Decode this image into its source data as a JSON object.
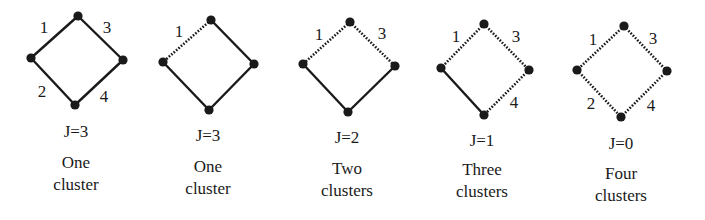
{
  "figure": {
    "colors": {
      "ink": "#1a1a1a",
      "background": "#ffffff"
    },
    "panels": [
      {
        "j_label": "J=3",
        "caption_line1": "One",
        "caption_line2": "cluster",
        "vertices": {
          "top": [
            78,
            16
          ],
          "left": [
            31,
            58
          ],
          "right": [
            123,
            60
          ],
          "bottom": [
            75,
            105
          ]
        },
        "edges": [
          {
            "id": "1",
            "from": "top",
            "to": "left",
            "style": "solid",
            "label": "1",
            "label_pos": [
              44,
              27
            ]
          },
          {
            "id": "2",
            "from": "left",
            "to": "bottom",
            "style": "solid",
            "label": "2",
            "label_pos": [
              42,
              91
            ]
          },
          {
            "id": "3",
            "from": "top",
            "to": "right",
            "style": "solid",
            "label": "3",
            "label_pos": [
              107,
              27
            ]
          },
          {
            "id": "4",
            "from": "right",
            "to": "bottom",
            "style": "solid",
            "label": "4",
            "label_pos": [
              104,
              96
            ]
          }
        ],
        "j_pos": [
          76,
          122
        ],
        "caption_pos": [
          76,
          152
        ]
      },
      {
        "j_label": "J=3",
        "caption_line1": "One",
        "caption_line2": "cluster",
        "vertices": {
          "top": [
            211,
            20
          ],
          "left": [
            163,
            62
          ],
          "right": [
            254,
            64
          ],
          "bottom": [
            209,
            110
          ]
        },
        "edges": [
          {
            "id": "1",
            "from": "top",
            "to": "left",
            "style": "dotted",
            "label": "1",
            "label_pos": [
              179,
              31
            ]
          },
          {
            "id": "2",
            "from": "left",
            "to": "bottom",
            "style": "solid",
            "label": "",
            "label_pos": [
              0,
              0
            ]
          },
          {
            "id": "3",
            "from": "top",
            "to": "right",
            "style": "solid",
            "label": "",
            "label_pos": [
              0,
              0
            ]
          },
          {
            "id": "4",
            "from": "right",
            "to": "bottom",
            "style": "solid",
            "label": "",
            "label_pos": [
              0,
              0
            ]
          }
        ],
        "j_pos": [
          208,
          126
        ],
        "caption_pos": [
          208,
          156
        ]
      },
      {
        "j_label": "J=2",
        "caption_line1": "Two",
        "caption_line2": "clusters",
        "vertices": {
          "top": [
            350,
            22
          ],
          "left": [
            303,
            64
          ],
          "right": [
            395,
            66
          ],
          "bottom": [
            348,
            112
          ]
        },
        "edges": [
          {
            "id": "1",
            "from": "top",
            "to": "left",
            "style": "dotted",
            "label": "1",
            "label_pos": [
              319,
              34
            ]
          },
          {
            "id": "2",
            "from": "left",
            "to": "bottom",
            "style": "solid",
            "label": "",
            "label_pos": [
              0,
              0
            ]
          },
          {
            "id": "3",
            "from": "top",
            "to": "right",
            "style": "dotted",
            "label": "3",
            "label_pos": [
              382,
              33
            ]
          },
          {
            "id": "4",
            "from": "right",
            "to": "bottom",
            "style": "solid",
            "label": "",
            "label_pos": [
              0,
              0
            ]
          }
        ],
        "j_pos": [
          347,
          128
        ],
        "caption_pos": [
          347,
          158
        ]
      },
      {
        "j_label": "J=1",
        "caption_line1": "Three",
        "caption_line2": "clusters",
        "vertices": {
          "top": [
            484,
            24
          ],
          "left": [
            441,
            68
          ],
          "right": [
            529,
            70
          ],
          "bottom": [
            484,
            115
          ]
        },
        "edges": [
          {
            "id": "1",
            "from": "top",
            "to": "left",
            "style": "dotted",
            "label": "1",
            "label_pos": [
              456,
              36
            ]
          },
          {
            "id": "2",
            "from": "left",
            "to": "bottom",
            "style": "solid",
            "label": "",
            "label_pos": [
              0,
              0
            ]
          },
          {
            "id": "3",
            "from": "top",
            "to": "right",
            "style": "dotted",
            "label": "3",
            "label_pos": [
              516,
              36
            ]
          },
          {
            "id": "4",
            "from": "right",
            "to": "bottom",
            "style": "dotted",
            "label": "4",
            "label_pos": [
              514,
              102
            ]
          }
        ],
        "j_pos": [
          482,
          131
        ],
        "caption_pos": [
          482,
          159
        ]
      },
      {
        "j_label": "J=0",
        "caption_line1": "Four",
        "caption_line2": "clusters",
        "vertices": {
          "top": [
            624,
            26
          ],
          "left": [
            577,
            70
          ],
          "right": [
            667,
            71
          ],
          "bottom": [
            621,
            117
          ]
        },
        "edges": [
          {
            "id": "1",
            "from": "top",
            "to": "left",
            "style": "dotted",
            "label": "1",
            "label_pos": [
              593,
              39
            ]
          },
          {
            "id": "2",
            "from": "left",
            "to": "bottom",
            "style": "dotted",
            "label": "2",
            "label_pos": [
              591,
              103
            ]
          },
          {
            "id": "3",
            "from": "top",
            "to": "right",
            "style": "dotted",
            "label": "3",
            "label_pos": [
              653,
              38
            ]
          },
          {
            "id": "4",
            "from": "right",
            "to": "bottom",
            "style": "dotted",
            "label": "4",
            "label_pos": [
              651,
              105
            ]
          }
        ],
        "j_pos": [
          621,
          134
        ],
        "caption_pos": [
          621,
          163
        ]
      }
    ]
  }
}
